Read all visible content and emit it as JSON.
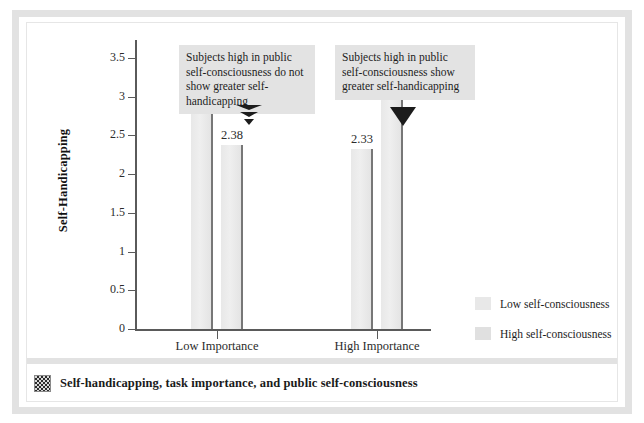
{
  "caption": {
    "icon": "dither-square-icon",
    "text": "Self-handicapping, task importance, and public self-consciousness"
  },
  "annotations": [
    {
      "name": "callout-low-importance",
      "text": "Subjects high in public self-consciousness do not show greater self-handicapping",
      "marker": "striped-down-triangle-icon"
    },
    {
      "name": "callout-high-importance",
      "text": "Subjects high in public self-consciousness show greater self-handicapping",
      "marker": "solid-down-triangle-icon"
    }
  ],
  "chart_data": {
    "type": "bar",
    "title": "",
    "xlabel": "Task Importance",
    "ylabel": "Self-Handicapping",
    "categories": [
      "Low Importance",
      "High Importance"
    ],
    "series": [
      {
        "name": "Low self-consciousness",
        "values": [
          2.81,
          2.33
        ],
        "color": "#e8e8e8"
      },
      {
        "name": "High self-consciousness",
        "values": [
          2.38,
          3.25
        ],
        "color": "#e8e8e8"
      }
    ],
    "value_labels": [
      "2.81",
      "2.38",
      "2.33",
      "3.25"
    ],
    "ylim": [
      0,
      3.5
    ],
    "yticks": [
      0,
      0.5,
      1,
      1.5,
      2,
      2.5,
      3,
      3.5
    ],
    "ytick_labels": [
      "0",
      "0.5",
      "1",
      "1.5",
      "2",
      "2.5",
      "3",
      "3.5"
    ],
    "grid": false,
    "legend_position": "right"
  },
  "legend": {
    "entries": [
      {
        "label": "Low self-consciousness",
        "swatch": "#e8e8e8"
      },
      {
        "label": "High self-consciousness",
        "swatch": "#e0e0e0"
      }
    ]
  }
}
